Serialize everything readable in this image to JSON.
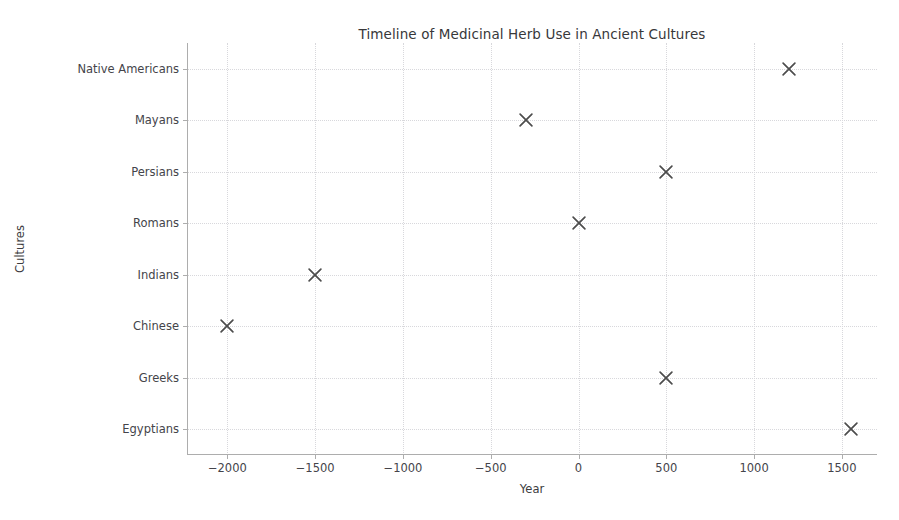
{
  "chart_data": {
    "type": "scatter",
    "title": "Timeline of Medicinal Herb Use in Ancient Cultures",
    "xlabel": "Year",
    "ylabel": "Cultures",
    "grid": true,
    "legend": "none",
    "marker": "x",
    "marker_color": "#4d4d4d",
    "xlim": [
      -2230,
      1700
    ],
    "xticks": [
      -2000,
      -1500,
      -1000,
      -500,
      0,
      500,
      1000,
      1500
    ],
    "xtick_labels": [
      "−2000",
      "−1500",
      "−1000",
      "−500",
      "0",
      "500",
      "1000",
      "1500"
    ],
    "categories": [
      "Native Americans",
      "Mayans",
      "Persians",
      "Romans",
      "Indians",
      "Chinese",
      "Greeks",
      "Egyptians"
    ],
    "points": [
      {
        "culture": "Native Americans",
        "year": 1200
      },
      {
        "culture": "Mayans",
        "year": -300
      },
      {
        "culture": "Persians",
        "year": 500
      },
      {
        "culture": "Romans",
        "year": 0
      },
      {
        "culture": "Indians",
        "year": -1500
      },
      {
        "culture": "Chinese",
        "year": -2000
      },
      {
        "culture": "Greeks",
        "year": 500
      },
      {
        "culture": "Egyptians",
        "year": 1550
      }
    ],
    "values": [
      1200,
      -300,
      500,
      0,
      -1500,
      -2000,
      500,
      1550
    ]
  },
  "colors": {
    "background": "#ffffff",
    "text": "#3a3a3a",
    "grid": "#d8d8dc",
    "spine": "#adadad",
    "marker": "#4d4d4d"
  }
}
